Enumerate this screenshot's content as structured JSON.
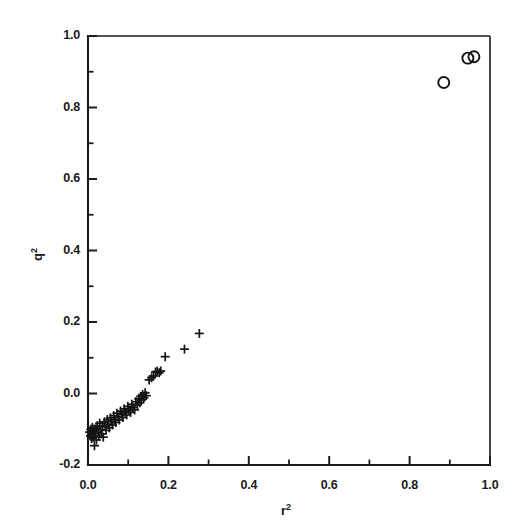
{
  "figure": {
    "background_color": "#ffffff",
    "ink_color": "#1a1a1a",
    "width": 523,
    "height": 532
  },
  "axis_titles": {
    "x_base": "r",
    "x_sup": "2",
    "y_base": "q",
    "y_sup": "2"
  },
  "ticks": {
    "x_major_labels": [
      "0.0",
      "0.2",
      "0.4",
      "0.6",
      "0.8",
      "1.0"
    ],
    "y_major_labels": [
      "1.0",
      "0.8",
      "0.6",
      "0.4",
      "0.2",
      "0.0",
      "-0.2"
    ]
  },
  "chart_data": {
    "type": "scatter",
    "title": "",
    "subtitle": "",
    "xlabel": "r2",
    "ylabel": "q2",
    "xlim": [
      0.0,
      1.0
    ],
    "ylim": [
      -0.2,
      1.0
    ],
    "x_major_ticks": [
      0.0,
      0.2,
      0.4,
      0.6,
      0.8,
      1.0
    ],
    "x_minor_ticks": [
      0.1,
      0.3,
      0.5,
      0.7,
      0.9
    ],
    "y_major_ticks": [
      -0.2,
      0.0,
      0.2,
      0.4,
      0.6,
      0.8,
      1.0
    ],
    "y_minor_ticks": [
      -0.1,
      0.1,
      0.3,
      0.5,
      0.7,
      0.9
    ],
    "grid": false,
    "legend": null,
    "legend_position": "none",
    "annotations": [],
    "series": [
      {
        "name": "plus-markers",
        "marker": "plus",
        "marker_size": 9,
        "color": "#141414",
        "points": [
          [
            0.004,
            -0.108
          ],
          [
            0.006,
            -0.119
          ],
          [
            0.007,
            -0.1
          ],
          [
            0.009,
            -0.126
          ],
          [
            0.01,
            -0.113
          ],
          [
            0.011,
            -0.095
          ],
          [
            0.013,
            -0.122
          ],
          [
            0.014,
            -0.104
          ],
          [
            0.016,
            -0.146
          ],
          [
            0.018,
            -0.112
          ],
          [
            0.019,
            -0.099
          ],
          [
            0.021,
            -0.13
          ],
          [
            0.023,
            -0.09
          ],
          [
            0.025,
            -0.108
          ],
          [
            0.027,
            -0.119
          ],
          [
            0.029,
            -0.083
          ],
          [
            0.031,
            -0.101
          ],
          [
            0.034,
            -0.113
          ],
          [
            0.036,
            -0.093
          ],
          [
            0.038,
            -0.122
          ],
          [
            0.041,
            -0.079
          ],
          [
            0.043,
            -0.09
          ],
          [
            0.045,
            -0.103
          ],
          [
            0.048,
            -0.073
          ],
          [
            0.05,
            -0.086
          ],
          [
            0.053,
            -0.096
          ],
          [
            0.056,
            -0.068
          ],
          [
            0.058,
            -0.079
          ],
          [
            0.061,
            -0.088
          ],
          [
            0.064,
            -0.062
          ],
          [
            0.066,
            -0.073
          ],
          [
            0.069,
            -0.081
          ],
          [
            0.072,
            -0.055
          ],
          [
            0.075,
            -0.066
          ],
          [
            0.078,
            -0.074
          ],
          [
            0.081,
            -0.049
          ],
          [
            0.084,
            -0.058
          ],
          [
            0.087,
            -0.067
          ],
          [
            0.09,
            -0.043
          ],
          [
            0.093,
            -0.052
          ],
          [
            0.096,
            -0.06
          ],
          [
            0.099,
            -0.036
          ],
          [
            0.102,
            -0.046
          ],
          [
            0.106,
            -0.053
          ],
          [
            0.109,
            -0.03
          ],
          [
            0.112,
            -0.039
          ],
          [
            0.116,
            -0.046
          ],
          [
            0.119,
            -0.023
          ],
          [
            0.123,
            -0.032
          ],
          [
            0.126,
            -0.015
          ],
          [
            0.129,
            -0.026
          ],
          [
            0.131,
            -0.008
          ],
          [
            0.133,
            -0.018
          ],
          [
            0.136,
            -0.003
          ],
          [
            0.139,
            -0.012
          ],
          [
            0.142,
            0.002
          ],
          [
            0.145,
            -0.006
          ],
          [
            0.152,
            0.038
          ],
          [
            0.158,
            0.044
          ],
          [
            0.163,
            0.049
          ],
          [
            0.168,
            0.06
          ],
          [
            0.172,
            0.062
          ],
          [
            0.177,
            0.058
          ],
          [
            0.181,
            0.063
          ],
          [
            0.192,
            0.103
          ],
          [
            0.24,
            0.124
          ],
          [
            0.277,
            0.168
          ]
        ]
      },
      {
        "name": "circle-markers",
        "marker": "circle",
        "marker_size": 11,
        "color": "#141414",
        "points": [
          [
            0.885,
            0.87
          ],
          [
            0.945,
            0.938
          ],
          [
            0.96,
            0.942
          ]
        ]
      }
    ]
  }
}
